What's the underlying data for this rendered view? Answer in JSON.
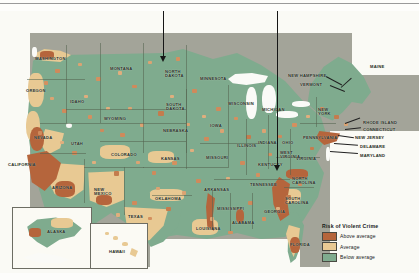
{
  "figure": {
    "kind": "choropleth-map",
    "legend": {
      "title": "Risk of Violent Crime",
      "items": [
        {
          "label": "Above average",
          "color": "#b5653c"
        },
        {
          "label": "Average",
          "color": "#e8c993"
        },
        {
          "label": "Below average",
          "color": "#7fab8e"
        }
      ]
    },
    "annotations": [
      {
        "name": "arrow-north-dakota",
        "target": "NORTH DAKOTA"
      },
      {
        "name": "arrow-north-carolina",
        "target": "NORTH CAROLINA"
      }
    ],
    "insets": [
      {
        "label": "ALASKA"
      },
      {
        "label": "HAWAII"
      }
    ],
    "state_labels": [
      {
        "id": "washington",
        "text": "WASHINGTON",
        "x": 35,
        "y": 46
      },
      {
        "id": "oregon",
        "text": "OREGON",
        "x": 26,
        "y": 78
      },
      {
        "id": "idaho",
        "text": "IDAHO",
        "x": 70,
        "y": 89
      },
      {
        "id": "montana",
        "text": "MONTANA",
        "x": 110,
        "y": 56
      },
      {
        "id": "north-dakota",
        "text": "NORTH\nDAKOTA",
        "x": 165,
        "y": 59
      },
      {
        "id": "south-dakota",
        "text": "SOUTH\nDAKOTA",
        "x": 166,
        "y": 92
      },
      {
        "id": "minnesota",
        "text": "MINNESOTA",
        "x": 200,
        "y": 66
      },
      {
        "id": "wisconsin",
        "text": "WISCONSIN",
        "x": 228,
        "y": 91
      },
      {
        "id": "michigan",
        "text": "MICHIGAN",
        "x": 262,
        "y": 97
      },
      {
        "id": "wyoming",
        "text": "WYOMING",
        "x": 104,
        "y": 106
      },
      {
        "id": "nebraska",
        "text": "NEBRASKA",
        "x": 163,
        "y": 118
      },
      {
        "id": "iowa",
        "text": "IOWA",
        "x": 210,
        "y": 113
      },
      {
        "id": "illinois",
        "text": "ILLINOIS",
        "x": 237,
        "y": 133
      },
      {
        "id": "indiana",
        "text": "INDIANA",
        "x": 258,
        "y": 130
      },
      {
        "id": "ohio",
        "text": "OHIO",
        "x": 282,
        "y": 130
      },
      {
        "id": "nevada",
        "text": "NEVADA",
        "x": 34,
        "y": 125
      },
      {
        "id": "utah",
        "text": "UTAH",
        "x": 71,
        "y": 131
      },
      {
        "id": "colorado",
        "text": "COLORADO",
        "x": 111,
        "y": 142
      },
      {
        "id": "kansas",
        "text": "KANSAS",
        "x": 161,
        "y": 146
      },
      {
        "id": "missouri",
        "text": "MISSOURI",
        "x": 206,
        "y": 145
      },
      {
        "id": "kentucky",
        "text": "KENTUCKY",
        "x": 258,
        "y": 152
      },
      {
        "id": "california",
        "text": "CALIFORNIA",
        "x": 8,
        "y": 152
      },
      {
        "id": "arizona",
        "text": "ARIZONA",
        "x": 52,
        "y": 175
      },
      {
        "id": "new-mexico",
        "text": "NEW\nMEXICO",
        "x": 94,
        "y": 177
      },
      {
        "id": "oklahoma",
        "text": "OKLAHOMA",
        "x": 155,
        "y": 186
      },
      {
        "id": "texas",
        "text": "TEXAS",
        "x": 128,
        "y": 204
      },
      {
        "id": "arkansas",
        "text": "ARKANSAS",
        "x": 204,
        "y": 177
      },
      {
        "id": "tennessee",
        "text": "TENNESSEE",
        "x": 250,
        "y": 172
      },
      {
        "id": "mississippi",
        "text": "MISSISSIPPI",
        "x": 217,
        "y": 196
      },
      {
        "id": "alabama",
        "text": "ALABAMA",
        "x": 232,
        "y": 210
      },
      {
        "id": "louisiana",
        "text": "LOUISIANA",
        "x": 196,
        "y": 216
      },
      {
        "id": "georgia",
        "text": "GEORGIA",
        "x": 264,
        "y": 199
      },
      {
        "id": "florida",
        "text": "FLORIDA",
        "x": 290,
        "y": 232
      },
      {
        "id": "south-carolina",
        "text": "SOUTH\nCAROLINA",
        "x": 285,
        "y": 186
      },
      {
        "id": "north-carolina",
        "text": "NORTH\nCAROLINA",
        "x": 292,
        "y": 166
      },
      {
        "id": "virginia",
        "text": "VIRGINIA",
        "x": 296,
        "y": 146
      },
      {
        "id": "west-virginia",
        "text": "WEST\nVIRGINIA",
        "x": 280,
        "y": 140
      },
      {
        "id": "pennsylvania",
        "text": "PENNSYLVANIA",
        "x": 303,
        "y": 125
      },
      {
        "id": "new-york",
        "text": "NEW\nYORK",
        "x": 318,
        "y": 97
      },
      {
        "id": "maine",
        "text": "MAINE",
        "x": 370,
        "y": 54
      },
      {
        "id": "new-hampshire",
        "text": "NEW HAMPSHIRE",
        "x": 288,
        "y": 63
      },
      {
        "id": "vermont",
        "text": "VERMONT",
        "x": 300,
        "y": 72
      },
      {
        "id": "rhode-island",
        "text": "RHODE ISLAND",
        "x": 363,
        "y": 110
      },
      {
        "id": "connecticut",
        "text": "CONNECTICUT",
        "x": 363,
        "y": 117
      },
      {
        "id": "new-jersey",
        "text": "NEW JERSEY",
        "x": 355,
        "y": 125
      },
      {
        "id": "delaware",
        "text": "DELAWARE",
        "x": 360,
        "y": 134
      },
      {
        "id": "maryland",
        "text": "MARYLAND",
        "x": 360,
        "y": 143
      }
    ]
  }
}
